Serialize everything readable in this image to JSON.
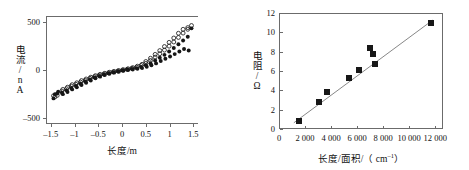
{
  "figure": {
    "background_color": "#ffffff",
    "axis_color": "#6b6b6b",
    "marker_color": "#161616"
  },
  "chart_data": [
    {
      "id": "left",
      "type": "scatter",
      "title": "",
      "xlabel": "长度/m",
      "ylabel": "电流/nA",
      "xlim": [
        -1.6,
        1.6
      ],
      "ylim": [
        -560,
        560
      ],
      "xticks": [
        -1.5,
        -1,
        -0.5,
        0,
        0.5,
        1,
        1.5
      ],
      "xticklabels": [
        "–1.5",
        "–1",
        "–0.5",
        "0",
        "0.5",
        "1",
        "1.5"
      ],
      "yticks": [
        -500,
        0,
        500
      ],
      "yticklabels": [
        "–500",
        "0",
        "500"
      ],
      "grid": false,
      "legend": "none",
      "frame": "open-left-top-bottom",
      "marker_styles": [
        "open-circle",
        "filled-circle"
      ],
      "series": [
        {
          "name": "I-V sweep (multiple cycles)",
          "marker": "mixed",
          "points": [
            [
              -1.48,
              -300
            ],
            [
              -1.48,
              -272
            ],
            [
              -1.45,
              -255
            ],
            [
              -1.45,
              -285
            ],
            [
              -1.4,
              -248
            ],
            [
              -1.4,
              -268
            ],
            [
              -1.38,
              -230
            ],
            [
              -1.3,
              -222
            ],
            [
              -1.3,
              -240
            ],
            [
              -1.28,
              -205
            ],
            [
              -1.28,
              -255
            ],
            [
              -1.2,
              -198
            ],
            [
              -1.2,
              -215
            ],
            [
              -1.18,
              -182
            ],
            [
              -1.18,
              -232
            ],
            [
              -1.1,
              -170
            ],
            [
              -1.1,
              -190
            ],
            [
              -1.08,
              -155
            ],
            [
              -1.08,
              -205
            ],
            [
              -1.0,
              -150
            ],
            [
              -1.0,
              -168
            ],
            [
              -0.98,
              -135
            ],
            [
              -0.98,
              -182
            ],
            [
              -0.9,
              -128
            ],
            [
              -0.9,
              -145
            ],
            [
              -0.88,
              -112
            ],
            [
              -0.88,
              -158
            ],
            [
              -0.8,
              -108
            ],
            [
              -0.8,
              -122
            ],
            [
              -0.78,
              -95
            ],
            [
              -0.78,
              -134
            ],
            [
              -0.7,
              -88
            ],
            [
              -0.7,
              -100
            ],
            [
              -0.68,
              -76
            ],
            [
              -0.68,
              -110
            ],
            [
              -0.6,
              -70
            ],
            [
              -0.6,
              -80
            ],
            [
              -0.58,
              -60
            ],
            [
              -0.58,
              -88
            ],
            [
              -0.5,
              -55
            ],
            [
              -0.5,
              -63
            ],
            [
              -0.48,
              -46
            ],
            [
              -0.48,
              -70
            ],
            [
              -0.4,
              -42
            ],
            [
              -0.4,
              -48
            ],
            [
              -0.38,
              -35
            ],
            [
              -0.38,
              -54
            ],
            [
              -0.3,
              -30
            ],
            [
              -0.3,
              -35
            ],
            [
              -0.28,
              -24
            ],
            [
              -0.28,
              -40
            ],
            [
              -0.2,
              -20
            ],
            [
              -0.2,
              -24
            ],
            [
              -0.18,
              -15
            ],
            [
              -0.18,
              -28
            ],
            [
              -0.1,
              -10
            ],
            [
              -0.1,
              -14
            ],
            [
              -0.08,
              -6
            ],
            [
              -0.08,
              -18
            ],
            [
              0.0,
              0
            ],
            [
              0.0,
              -4
            ],
            [
              0.02,
              3
            ],
            [
              0.02,
              -8
            ],
            [
              0.1,
              8
            ],
            [
              0.1,
              4
            ],
            [
              0.12,
              13
            ],
            [
              0.12,
              0
            ],
            [
              0.2,
              18
            ],
            [
              0.2,
              12
            ],
            [
              0.22,
              25
            ],
            [
              0.22,
              6
            ],
            [
              0.3,
              30
            ],
            [
              0.3,
              20
            ],
            [
              0.32,
              40
            ],
            [
              0.32,
              12
            ],
            [
              0.4,
              48
            ],
            [
              0.4,
              32
            ],
            [
              0.42,
              60
            ],
            [
              0.42,
              20
            ],
            [
              0.5,
              70
            ],
            [
              0.5,
              50
            ],
            [
              0.5,
              90
            ],
            [
              0.52,
              34
            ],
            [
              0.6,
              100
            ],
            [
              0.6,
              72
            ],
            [
              0.6,
              124
            ],
            [
              0.62,
              50
            ],
            [
              0.7,
              136
            ],
            [
              0.7,
              100
            ],
            [
              0.7,
              165
            ],
            [
              0.72,
              70
            ],
            [
              0.8,
              172
            ],
            [
              0.8,
              130
            ],
            [
              0.8,
              205
            ],
            [
              0.82,
              95
            ],
            [
              0.9,
              210
            ],
            [
              0.9,
              160
            ],
            [
              0.9,
              248
            ],
            [
              0.92,
              118
            ],
            [
              1.0,
              252
            ],
            [
              1.0,
              196
            ],
            [
              1.0,
              292
            ],
            [
              1.02,
              142
            ],
            [
              1.1,
              296
            ],
            [
              1.1,
              232
            ],
            [
              1.1,
              338
            ],
            [
              1.12,
              168
            ],
            [
              1.2,
              344
            ],
            [
              1.2,
              272
            ],
            [
              1.2,
              388
            ],
            [
              1.22,
              196
            ],
            [
              1.3,
              390
            ],
            [
              1.3,
              312
            ],
            [
              1.3,
              430
            ],
            [
              1.32,
              222
            ],
            [
              1.4,
              430
            ],
            [
              1.4,
              352
            ],
            [
              1.4,
              448
            ],
            [
              1.42,
              206
            ],
            [
              1.48,
              470
            ],
            [
              1.48,
              440
            ]
          ]
        }
      ]
    },
    {
      "id": "right",
      "type": "scatter",
      "title": "",
      "xlabel_parts": {
        "prefix": "长度/面积/（ cm",
        "superscript": "–1",
        "suffix": "）"
      },
      "xlabel": "长度/面积/（ cm⁻¹）",
      "ylabel": "电阻/Ω",
      "xlim": [
        0,
        12600
      ],
      "ylim": [
        0,
        12
      ],
      "xticks": [
        0,
        2000,
        4000,
        6000,
        8000,
        10000,
        12000
      ],
      "xticklabels": [
        "0",
        "2 000",
        "4 000",
        "6 000",
        "8 000",
        "10 000",
        "12 000"
      ],
      "yticks": [
        0,
        2,
        4,
        6,
        8,
        10,
        12
      ],
      "yticklabels": [
        "0",
        "2",
        "4",
        "6",
        "8",
        "10",
        "12"
      ],
      "grid": false,
      "legend": "none",
      "frame": "box",
      "marker_styles": [
        "filled-square"
      ],
      "series": [
        {
          "name": "电阻 vs 长度/面积",
          "marker": "filled-square",
          "points": [
            [
              1450,
              0.95
            ],
            [
              2980,
              2.9
            ],
            [
              3600,
              3.9
            ],
            [
              5300,
              5.35
            ],
            [
              6100,
              6.25
            ],
            [
              6950,
              8.5
            ],
            [
              7150,
              7.9
            ],
            [
              7300,
              6.8
            ],
            [
              11600,
              11.1
            ]
          ]
        }
      ],
      "fit_line": {
        "name": "linear fit",
        "x0": 1050,
        "y0": 0.55,
        "x1": 11900,
        "y1": 11.35
      }
    }
  ]
}
